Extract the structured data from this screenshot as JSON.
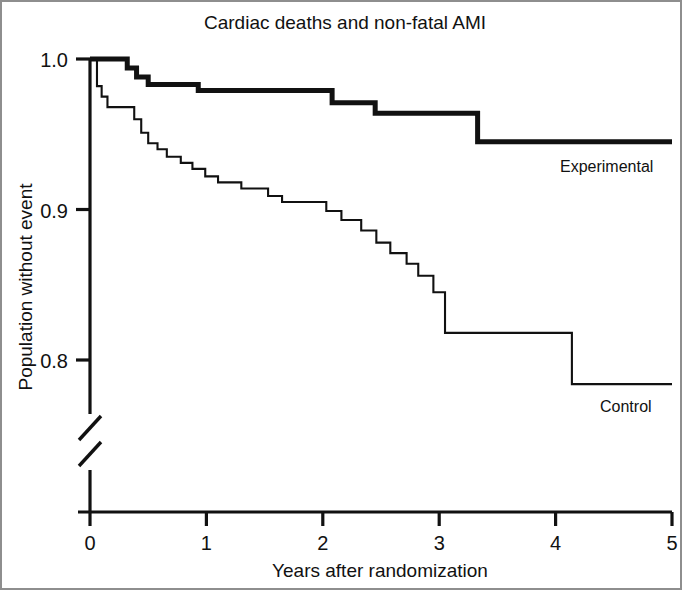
{
  "chart_data": {
    "type": "line",
    "subtype": "kaplan-meier-step",
    "title": "Cardiac deaths and non-fatal AMI",
    "xlabel": "Years after randomization",
    "ylabel": "Population without event",
    "xlim": [
      0,
      5
    ],
    "ylim": [
      0.77,
      1.005
    ],
    "grid": false,
    "legend_position": "inline-right-of-curve",
    "axis_break": {
      "present": true,
      "axis": "y",
      "note": "broken y-axis below 0.8"
    },
    "xticks": [
      0,
      1,
      2,
      3,
      4,
      5
    ],
    "xtick_labels": [
      "0",
      "1",
      "2",
      "3",
      "4",
      "5"
    ],
    "yticks": [
      1.0,
      0.9,
      0.8
    ],
    "ytick_labels": [
      "1.0",
      "0.9",
      "0.8"
    ],
    "series": [
      {
        "name": "Experimental",
        "label": "Experimental",
        "line_width": "thick",
        "color": "#111111",
        "x": [
          0.0,
          0.32,
          0.32,
          0.4,
          0.4,
          0.5,
          0.5,
          0.93,
          0.93,
          2.08,
          2.08,
          2.45,
          2.45,
          3.33,
          3.33,
          5.0
        ],
        "y": [
          1.0,
          1.0,
          0.994,
          0.994,
          0.988,
          0.988,
          0.983,
          0.983,
          0.979,
          0.979,
          0.971,
          0.971,
          0.964,
          0.964,
          0.945,
          0.945
        ]
      },
      {
        "name": "Control",
        "label": "Control",
        "line_width": "thin",
        "color": "#111111",
        "x": [
          0.0,
          0.06,
          0.06,
          0.1,
          0.1,
          0.15,
          0.15,
          0.38,
          0.38,
          0.44,
          0.44,
          0.5,
          0.5,
          0.58,
          0.58,
          0.66,
          0.66,
          0.78,
          0.78,
          0.88,
          0.88,
          0.99,
          0.99,
          1.1,
          1.1,
          1.3,
          1.3,
          1.53,
          1.53,
          1.65,
          1.65,
          2.03,
          2.03,
          2.16,
          2.16,
          2.33,
          2.33,
          2.46,
          2.46,
          2.58,
          2.58,
          2.72,
          2.72,
          2.82,
          2.82,
          2.95,
          2.95,
          3.05,
          3.05,
          3.33,
          3.33,
          4.14,
          4.14,
          5.0
        ],
        "y": [
          1.0,
          1.0,
          0.982,
          0.982,
          0.975,
          0.975,
          0.968,
          0.968,
          0.96,
          0.96,
          0.951,
          0.951,
          0.944,
          0.944,
          0.94,
          0.94,
          0.935,
          0.935,
          0.931,
          0.931,
          0.927,
          0.927,
          0.922,
          0.922,
          0.918,
          0.918,
          0.914,
          0.914,
          0.909,
          0.909,
          0.905,
          0.905,
          0.899,
          0.899,
          0.893,
          0.893,
          0.886,
          0.886,
          0.878,
          0.878,
          0.871,
          0.871,
          0.864,
          0.864,
          0.856,
          0.856,
          0.845,
          0.845,
          0.818,
          0.818,
          0.818,
          0.818,
          0.784,
          0.784
        ]
      }
    ]
  },
  "figure": {
    "title": "Cardiac deaths and non-fatal AMI",
    "xlabel": "Years after randomization",
    "ylabel": "Population without event",
    "ytick_labels": [
      "1.0",
      "0.9",
      "0.8"
    ],
    "xtick_labels": [
      "0",
      "1",
      "2",
      "3",
      "4",
      "5"
    ],
    "series_labels": {
      "experimental": "Experimental",
      "control": "Control"
    },
    "colors": {
      "ink": "#111111",
      "frame": "#8e8e8e",
      "background": "#ffffff"
    }
  }
}
